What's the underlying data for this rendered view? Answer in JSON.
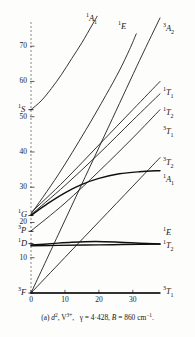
{
  "figure": {
    "caption_prefix": "(a)",
    "caption_config": "d",
    "caption_config_sup": "2",
    "caption_ion": "V",
    "caption_ion_sup": "3+",
    "caption_gamma": "γ = 4·428,",
    "caption_B": "B = 860 cm",
    "caption_B_sup": "−1",
    "caption_end": ".",
    "caption_full": "(a) d2, V3+,  γ = 4·428, B = 860 cm−1."
  },
  "axes": {
    "y_ticks": [
      "10",
      "20",
      "30",
      "40",
      "50",
      "60",
      "70"
    ],
    "x_ticks": [
      "0",
      "10",
      "20",
      "30"
    ],
    "x_min": 0,
    "x_max": 38,
    "y_min": 0,
    "y_max": 78
  },
  "free_ion_terms": [
    {
      "name": "3F",
      "mult": "3",
      "term": "F",
      "energy": 0
    },
    {
      "name": "1D",
      "mult": "1",
      "term": "D",
      "energy": 14
    },
    {
      "name": "3P",
      "mult": "3",
      "term": "P",
      "energy": 17.5
    },
    {
      "name": "1G",
      "mult": "1",
      "term": "G",
      "energy": 22
    },
    {
      "name": "1S",
      "mult": "1",
      "term": "S",
      "energy": 52
    }
  ],
  "right_labels": [
    {
      "mult": "3",
      "letter": "A",
      "sub": "2"
    },
    {
      "mult": "1",
      "letter": "T",
      "sub": "1"
    },
    {
      "mult": "1",
      "letter": "T",
      "sub": "2"
    },
    {
      "mult": "3",
      "letter": "T",
      "sub": "1"
    },
    {
      "mult": "3",
      "letter": "T",
      "sub": "2"
    },
    {
      "mult": "1",
      "letter": "A",
      "sub": "1"
    },
    {
      "mult": "1",
      "letter": "E",
      "sub": ""
    },
    {
      "mult": "1",
      "letter": "T",
      "sub": "2"
    },
    {
      "mult": "3",
      "letter": "T",
      "sub": "1"
    }
  ],
  "top_labels": [
    {
      "mult": "1",
      "letter": "A",
      "sub": "1"
    },
    {
      "mult": "1",
      "letter": "E",
      "sub": ""
    }
  ],
  "chart_data": {
    "type": "line",
    "title": "",
    "xlabel": "",
    "ylabel": "",
    "xlim": [
      0,
      38
    ],
    "ylim": [
      0,
      78
    ],
    "x_ticks": [
      0,
      10,
      20,
      30
    ],
    "y_ticks": [
      10,
      20,
      30,
      40,
      50,
      60,
      70
    ],
    "grid": false,
    "legend": "inline-right-labels",
    "series": [
      {
        "name": "3T1(F)",
        "label": "3T1",
        "origin_term": "3F",
        "points": [
          [
            0,
            0
          ],
          [
            10,
            0
          ],
          [
            20,
            0
          ],
          [
            30,
            0
          ],
          [
            38,
            0
          ]
        ],
        "weight": "heavy"
      },
      {
        "name": "1T2",
        "label": "1T2",
        "origin_term": "1D",
        "points": [
          [
            0,
            13.6
          ],
          [
            6,
            14.0
          ],
          [
            12,
            14.4
          ],
          [
            19,
            14.6
          ],
          [
            26,
            14.4
          ],
          [
            32,
            14.1
          ],
          [
            38,
            13.9
          ]
        ],
        "weight": "heavy"
      },
      {
        "name": "1E",
        "label": "1E",
        "origin_term": "1D",
        "points": [
          [
            0,
            13.4
          ],
          [
            8,
            13.5
          ],
          [
            16,
            13.6
          ],
          [
            24,
            13.7
          ],
          [
            32,
            13.8
          ],
          [
            38,
            13.9
          ]
        ],
        "weight": "heavy"
      },
      {
        "name": "1A1",
        "label": "1A1",
        "origin_term": "1G",
        "points": [
          [
            0,
            22.0
          ],
          [
            5,
            25.4
          ],
          [
            10,
            28.4
          ],
          [
            15,
            30.8
          ],
          [
            20,
            32.5
          ],
          [
            26,
            33.8
          ],
          [
            32,
            34.4
          ],
          [
            38,
            34.7
          ]
        ],
        "weight": "heavy"
      },
      {
        "name": "3T2",
        "label": "3T2",
        "origin_term": "3F",
        "points": [
          [
            0,
            0
          ],
          [
            10,
            10.1
          ],
          [
            20,
            20.2
          ],
          [
            30,
            30.3
          ],
          [
            38,
            38.4
          ]
        ],
        "weight": "normal"
      },
      {
        "name": "3T1(P)",
        "label": "3T1",
        "origin_term": "3P",
        "points": [
          [
            0,
            17.6
          ],
          [
            10,
            25.5
          ],
          [
            20,
            34.5
          ],
          [
            30,
            44.0
          ],
          [
            38,
            52.0
          ]
        ],
        "weight": "normal"
      },
      {
        "name": "1T2(G)",
        "label": "1T2",
        "origin_term": "1G",
        "points": [
          [
            0,
            22.2
          ],
          [
            10,
            30.5
          ],
          [
            20,
            39.5
          ],
          [
            30,
            49.0
          ],
          [
            38,
            56.5
          ]
        ],
        "weight": "normal"
      },
      {
        "name": "1T1",
        "label": "1T1",
        "origin_term": "1G",
        "points": [
          [
            0,
            22.8
          ],
          [
            10,
            32.0
          ],
          [
            20,
            42.0
          ],
          [
            30,
            52.0
          ],
          [
            38,
            60.0
          ]
        ],
        "weight": "normal"
      },
      {
        "name": "3A2",
        "label": "3A2",
        "origin_term": "3F",
        "points": [
          [
            0,
            0
          ],
          [
            8,
            16.5
          ],
          [
            16,
            33.0
          ],
          [
            24,
            49.5
          ],
          [
            32,
            66.0
          ],
          [
            38,
            78.0
          ]
        ],
        "weight": "normal"
      },
      {
        "name": "1E(upper)",
        "label": "1E",
        "origin_term": "1G",
        "points": [
          [
            0,
            22.4
          ],
          [
            8,
            33.5
          ],
          [
            16,
            46.0
          ],
          [
            22,
            56.0
          ],
          [
            26,
            63.0
          ],
          [
            29,
            69.0
          ],
          [
            31,
            73.5
          ]
        ],
        "weight": "normal"
      },
      {
        "name": "1A1(S)",
        "label": "1A1",
        "origin_term": "1S",
        "points": [
          [
            0,
            52.0
          ],
          [
            3,
            54.5
          ],
          [
            6,
            58.0
          ],
          [
            9,
            62.0
          ],
          [
            12,
            66.5
          ],
          [
            15,
            71.0
          ],
          [
            18,
            76.0
          ],
          [
            19.5,
            78.5
          ]
        ],
        "weight": "normal"
      }
    ]
  }
}
